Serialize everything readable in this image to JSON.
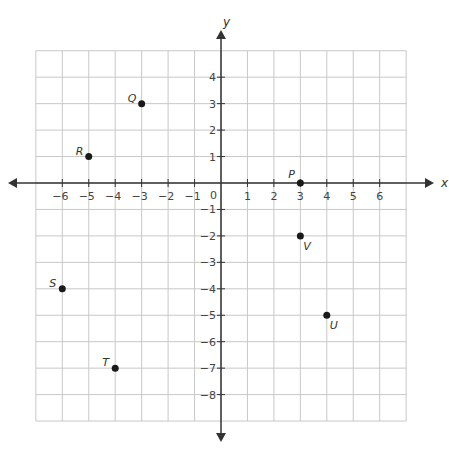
{
  "chart_data": {
    "type": "scatter",
    "title": "",
    "xlabel": "x",
    "ylabel": "y",
    "xlim": [
      -7,
      7
    ],
    "ylim": [
      -9,
      5
    ],
    "grid": true,
    "x_ticks": [
      -6,
      -5,
      -4,
      -3,
      -2,
      -1,
      1,
      2,
      3,
      4,
      5,
      6
    ],
    "y_ticks": [
      4,
      3,
      2,
      1,
      -1,
      -2,
      -3,
      -4,
      -5,
      -6,
      -7,
      -8
    ],
    "origin_label": "0",
    "points": [
      {
        "label": "P",
        "x": 3,
        "y": 0
      },
      {
        "label": "Q",
        "x": -3,
        "y": 3
      },
      {
        "label": "R",
        "x": -5,
        "y": 1
      },
      {
        "label": "S",
        "x": -6,
        "y": -4
      },
      {
        "label": "T",
        "x": -4,
        "y": -7
      },
      {
        "label": "U",
        "x": 4,
        "y": -5
      },
      {
        "label": "V",
        "x": 3,
        "y": -2
      }
    ]
  },
  "colors": {
    "grid": "#c8c8c8",
    "axis": "#333333",
    "point": "#1a1a1a",
    "text": "#444444"
  }
}
